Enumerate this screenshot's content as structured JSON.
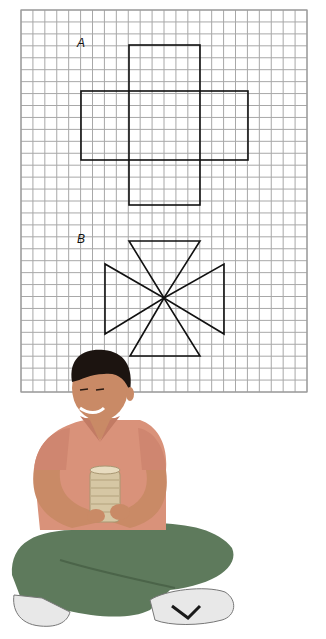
{
  "figure": {
    "grid": {
      "left": 21,
      "top": 10,
      "right": 307,
      "bottom": 392,
      "cell": 11.9,
      "line_color": "#a8a8a8",
      "border_color": "#9a9a9a"
    },
    "shapes": [
      {
        "label": "A",
        "label_pos": [
          77,
          48
        ],
        "type": "cross-net",
        "rects": [
          {
            "x": 129,
            "y": 45,
            "w": 71,
            "h": 160
          },
          {
            "x": 81,
            "y": 91,
            "w": 167,
            "h": 69
          }
        ]
      },
      {
        "label": "B",
        "label_pos": [
          77,
          244
        ],
        "type": "pinwheel-triangles",
        "center": [
          164,
          298
        ],
        "triangles": [
          [
            [
              129,
              241
            ],
            [
              200,
              241
            ]
          ],
          [
            [
              105,
              264
            ],
            [
              105,
              334
            ]
          ],
          [
            [
              224,
              264
            ],
            [
              224,
              334
            ]
          ],
          [
            [
              130,
              356
            ],
            [
              200,
              356
            ]
          ]
        ]
      }
    ],
    "stroke_color": "#111111",
    "photo": {
      "description": "Boy sitting cross-legged holding a cylindrical container",
      "colors": {
        "hair": "#1c1410",
        "skin": "#c98a66",
        "shirt": "#d9927a",
        "pants": "#5e7a5c",
        "container": "#d6c7a4",
        "shoe": "#e8e8e8",
        "shoe_accent": "#1a1a1a"
      }
    }
  }
}
